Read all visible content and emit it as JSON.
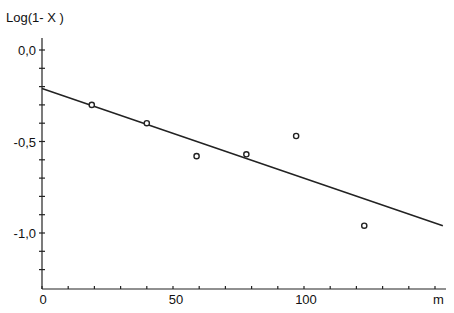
{
  "chart_data": {
    "type": "scatter",
    "title": "",
    "xlabel": "m",
    "ylabel": "Log(1- X )",
    "xlim": [
      0,
      158
    ],
    "ylim": [
      -1.3,
      0.1
    ],
    "x_ticks": [
      0,
      50,
      100
    ],
    "x_tick_labels": [
      "0",
      "50",
      "100"
    ],
    "y_ticks": [
      0.0,
      -0.5,
      -1.0
    ],
    "y_tick_labels": [
      "0,0",
      "-0,5",
      "-1,0"
    ],
    "grid": false,
    "legend": null,
    "series": [
      {
        "name": "data",
        "marker": "open-circle",
        "x": [
          19,
          40,
          59,
          78,
          97,
          123
        ],
        "y": [
          -0.3,
          -0.4,
          -0.58,
          -0.57,
          -0.47,
          -0.96
        ]
      },
      {
        "name": "fit",
        "style": "line",
        "x": [
          0,
          153
        ],
        "y": [
          -0.21,
          -0.96
        ]
      }
    ]
  }
}
